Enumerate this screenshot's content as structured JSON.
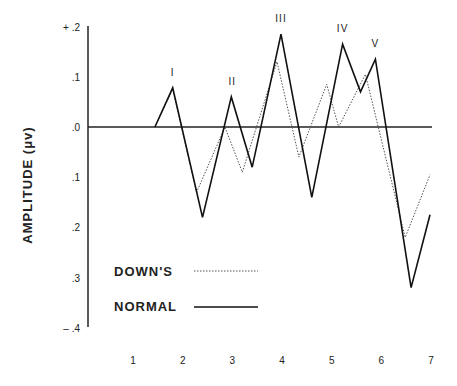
{
  "chart_data": {
    "type": "line",
    "title": "",
    "xlabel": "",
    "ylabel": "AMPLITUDE  (μv)",
    "x_ticks": [
      "1",
      "2",
      "3",
      "4",
      "5",
      "6",
      "7"
    ],
    "y_ticks": [
      "+ .2",
      ".1",
      ".0",
      ".1",
      ".2",
      ".3",
      "– .4"
    ],
    "ylim": [
      -0.4,
      0.2
    ],
    "xlim": [
      1,
      7
    ],
    "grid": false,
    "baseline": 0.0,
    "legend_position": "lower-left",
    "peak_labels": [
      {
        "label": "I",
        "x": 1.8,
        "y": 0.078
      },
      {
        "label": "II",
        "x": 3.0,
        "y": 0.06
      },
      {
        "label": "III",
        "x": 3.98,
        "y": 0.185
      },
      {
        "label": "IV",
        "x": 5.22,
        "y": 0.165
      },
      {
        "label": "V",
        "x": 5.88,
        "y": 0.135
      }
    ],
    "series": [
      {
        "name": "NORMAL",
        "style": "solid",
        "x": [
          1.44,
          1.8,
          2.4,
          2.98,
          3.4,
          3.98,
          4.6,
          5.22,
          5.58,
          5.88,
          6.6,
          6.98
        ],
        "y": [
          0.0,
          0.078,
          -0.18,
          0.06,
          -0.08,
          0.185,
          -0.14,
          0.165,
          0.07,
          0.135,
          -0.32,
          -0.175
        ]
      },
      {
        "name": "DOWN'S",
        "style": "dotted",
        "x": [
          1.44,
          1.8,
          2.28,
          2.85,
          3.2,
          3.9,
          4.34,
          4.9,
          5.14,
          5.68,
          6.48,
          6.98
        ],
        "y": [
          0.0,
          0.075,
          -0.13,
          0.0,
          -0.09,
          0.13,
          -0.06,
          0.085,
          0.0,
          0.105,
          -0.22,
          -0.095
        ]
      }
    ]
  },
  "legend": {
    "items": [
      {
        "label": "DOWN'S",
        "style": "dotted"
      },
      {
        "label": "NORMAL",
        "style": "solid"
      }
    ]
  },
  "axis": {
    "y_label": "AMPLITUDE  (μv)"
  }
}
